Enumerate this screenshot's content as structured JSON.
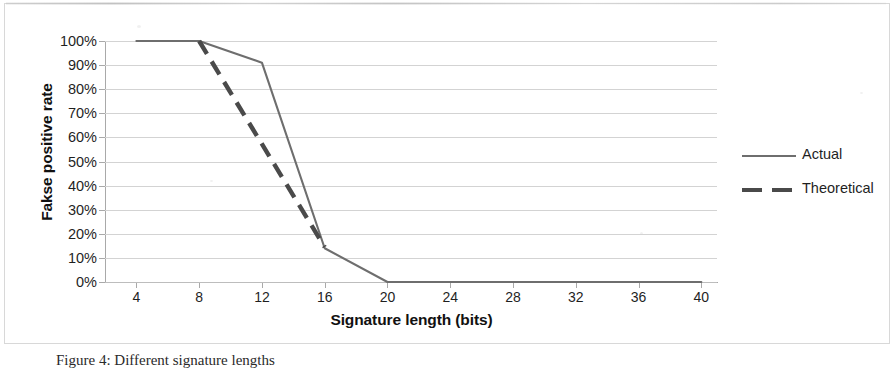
{
  "figure": {
    "caption": "Figure 4: Different signature lengths"
  },
  "chart_data": {
    "type": "line",
    "title": "",
    "xlabel": "Signature length (bits)",
    "ylabel": "Fakse positive rate",
    "xlim": [
      2,
      41
    ],
    "ylim": [
      0,
      1
    ],
    "grid": true,
    "legend_position": "right",
    "x_ticks": [
      4,
      8,
      12,
      16,
      20,
      24,
      28,
      32,
      36,
      40
    ],
    "x_tick_labels": [
      "4",
      "8",
      "12",
      "16",
      "20",
      "24",
      "28",
      "32",
      "36",
      "40"
    ],
    "y_ticks": [
      0,
      0.1,
      0.2,
      0.3,
      0.4,
      0.5,
      0.6,
      0.7,
      0.8,
      0.9,
      1.0
    ],
    "y_tick_labels": [
      "0%",
      "10%",
      "20%",
      "30%",
      "40%",
      "50%",
      "60%",
      "70%",
      "80%",
      "90%",
      "100%"
    ],
    "series": [
      {
        "name": "Actual",
        "style": "solid",
        "color": "#6e6e6e",
        "x": [
          4,
          8,
          12,
          16,
          20,
          24,
          28,
          32,
          36,
          40
        ],
        "values": [
          1.0,
          1.0,
          0.91,
          0.14,
          0.0,
          0.0,
          0.0,
          0.0,
          0.0,
          0.0
        ]
      },
      {
        "name": "Theoretical",
        "style": "dashed",
        "color": "#4a4a4a",
        "x": [
          8,
          16
        ],
        "values": [
          1.0,
          0.145
        ]
      }
    ]
  },
  "legend": {
    "items": [
      {
        "label": "Actual",
        "style": "solid"
      },
      {
        "label": "Theoretical",
        "style": "dashed"
      }
    ]
  },
  "colors": {
    "actual": "#6e6e6e",
    "theoretical": "#4a4a4a",
    "gridline": "#d3d3d3",
    "axis": "#a9a9a9",
    "frame": "#d8d8d8",
    "text": "#1f1f1f"
  }
}
